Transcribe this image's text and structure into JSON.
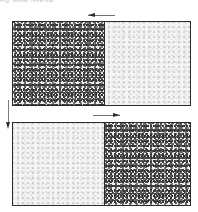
{
  "figure": {
    "caption_clipped": "Fig. shear reversal",
    "background_color": "#ffffff",
    "border_color": "#2b2b2b",
    "dense_texture_color": "#3a3a3a",
    "light_texture_color": "#b9b9b9",
    "arrow_color": "#2f2f2f"
  },
  "panels": [
    {
      "id": "top",
      "name": "upper-panel",
      "left_region": {
        "label": "",
        "fill": "dense-stipple"
      },
      "right_region": {
        "label": "",
        "fill": "light-stipple"
      },
      "arrow": {
        "name": "shear-arrow-left",
        "direction": "left"
      }
    },
    {
      "id": "bottom",
      "name": "lower-panel",
      "left_region": {
        "label": "",
        "fill": "light-stipple"
      },
      "right_region": {
        "label": "",
        "fill": "dense-stipple"
      },
      "arrow": {
        "name": "shear-arrow-right",
        "direction": "right"
      }
    }
  ],
  "connector": {
    "name": "time-progression-arrow",
    "direction": "down",
    "label": ""
  }
}
